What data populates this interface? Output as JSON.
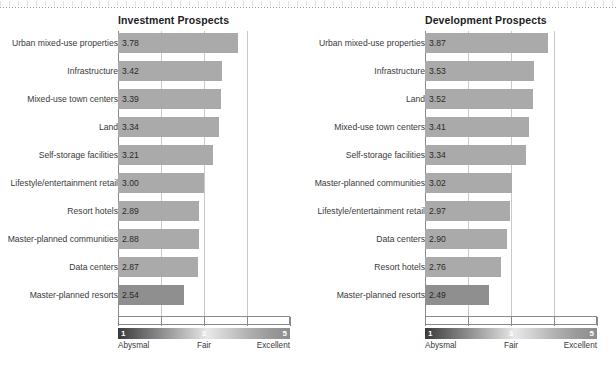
{
  "chart_data": [
    {
      "type": "bar",
      "title": "Investment Prospects",
      "orientation": "horizontal",
      "xlabel": "",
      "ylabel": "",
      "xlim": [
        1,
        5
      ],
      "ticks": [
        "1",
        "2",
        "3",
        "4",
        "5"
      ],
      "grid": true,
      "categories": [
        "Urban mixed-use properties",
        "Infrastructure",
        "Mixed-use town centers",
        "Land",
        "Self-storage facilities",
        "Lifestyle/entertainment retail",
        "Resort hotels",
        "Master-planned communities",
        "Data centers",
        "Master-planned resorts"
      ],
      "values": [
        3.78,
        3.42,
        3.39,
        3.34,
        3.21,
        3.0,
        2.89,
        2.88,
        2.87,
        2.54
      ],
      "labels": [
        "3.78",
        "3.42",
        "3.39",
        "3.34",
        "3.21",
        "3.00",
        "2.89",
        "2.88",
        "2.87",
        "2.54"
      ]
    },
    {
      "type": "bar",
      "title": "Development Prospects",
      "orientation": "horizontal",
      "xlabel": "",
      "ylabel": "",
      "xlim": [
        1,
        5
      ],
      "ticks": [
        "1",
        "2",
        "3",
        "4",
        "5"
      ],
      "grid": true,
      "categories": [
        "Urban mixed-use properties",
        "Infrastructure",
        "Land",
        "Mixed-use town centers",
        "Self-storage facilities",
        "Master-planned communities",
        "Lifestyle/entertainment retail",
        "Data centers",
        "Resort hotels",
        "Master-planned resorts"
      ],
      "values": [
        3.87,
        3.53,
        3.52,
        3.41,
        3.34,
        3.02,
        2.97,
        2.9,
        2.76,
        2.49
      ],
      "labels": [
        "3.87",
        "3.53",
        "3.52",
        "3.41",
        "3.34",
        "3.02",
        "2.97",
        "2.90",
        "2.76",
        "2.49"
      ]
    }
  ],
  "legend": {
    "scale_min": "1",
    "scale_mid": "3",
    "scale_max": "5",
    "label_min": "Abysmal",
    "label_mid": "Fair",
    "label_max": "Excellent"
  },
  "colors": {
    "bar": "#aaaaaa",
    "bar_last": "#8f8f8f",
    "gridline": "#c9c9c9",
    "axis": "#8a8a8a",
    "title_text": "#1d1d1d",
    "label_text": "#3a3a3a",
    "value_text": "#2a2a2a"
  }
}
